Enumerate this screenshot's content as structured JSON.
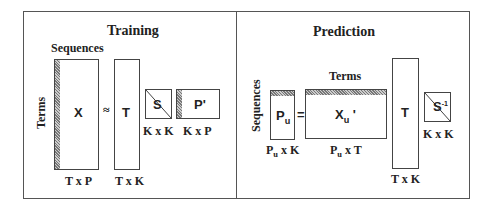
{
  "training": {
    "title": "Training",
    "sequences_label": "Sequences",
    "terms_label": "Terms",
    "approx_symbol": "≈",
    "matrices": [
      {
        "name": "X",
        "dims": "T x P"
      },
      {
        "name": "T",
        "dims": "T x K"
      },
      {
        "name": "S",
        "dims": "K x K"
      },
      {
        "name": "P'",
        "dims": "K x P"
      }
    ]
  },
  "prediction": {
    "title": "Prediction",
    "sequences_label": "Sequences",
    "terms_label": "Terms",
    "equals_symbol": "=",
    "matrices": [
      {
        "name": "P",
        "sub": "u",
        "dims_main": "P",
        "dims_sub": "u",
        "dims_rest": " x K"
      },
      {
        "name": "X",
        "sub": "u",
        "suffix": " '",
        "dims_main": "P",
        "dims_sub": "u",
        "dims_rest": " x T"
      },
      {
        "name": "T",
        "dims": "T x K"
      },
      {
        "name": "S",
        "sup": "-1",
        "dims": "K x K"
      }
    ]
  }
}
